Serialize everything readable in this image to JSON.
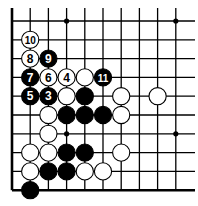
{
  "diagram": {
    "type": "go-board-fragment",
    "corner": "lower-left",
    "columns": 10,
    "rows": 10,
    "grid": {
      "x0": 12,
      "dx": 18.2,
      "y0": 21,
      "dy": 18.8,
      "right_extent": 195,
      "top_extent": 8
    },
    "edges": {
      "left": true,
      "bottom": true,
      "top": false,
      "right": false
    },
    "star_points": [
      [
        3,
        0
      ],
      [
        9,
        0
      ],
      [
        3,
        6
      ],
      [
        9,
        6
      ]
    ],
    "colors": {
      "line": "#000000",
      "black_stone": "#000000",
      "white_stone": "#ffffff",
      "background": "#ffffff"
    },
    "stones": [
      {
        "col": 1,
        "row": 1,
        "color": "white",
        "label": "10"
      },
      {
        "col": 1,
        "row": 2,
        "color": "white",
        "label": "8"
      },
      {
        "col": 2,
        "row": 2,
        "color": "black",
        "label": "9"
      },
      {
        "col": 1,
        "row": 3,
        "color": "black",
        "label": "7"
      },
      {
        "col": 2,
        "row": 3,
        "color": "white",
        "label": "6"
      },
      {
        "col": 3,
        "row": 3,
        "color": "white",
        "label": "4"
      },
      {
        "col": 4,
        "row": 3,
        "color": "white",
        "label": ""
      },
      {
        "col": 5,
        "row": 3,
        "color": "black",
        "label": "11"
      },
      {
        "col": 1,
        "row": 4,
        "color": "black",
        "label": "5"
      },
      {
        "col": 2,
        "row": 4,
        "color": "black",
        "label": "3"
      },
      {
        "col": 3,
        "row": 4,
        "color": "white",
        "label": ""
      },
      {
        "col": 4,
        "row": 4,
        "color": "black",
        "label": ""
      },
      {
        "col": 6,
        "row": 4,
        "color": "white",
        "label": ""
      },
      {
        "col": 8,
        "row": 4,
        "color": "white",
        "label": ""
      },
      {
        "col": 2,
        "row": 5,
        "color": "white",
        "label": ""
      },
      {
        "col": 3,
        "row": 5,
        "color": "black",
        "label": ""
      },
      {
        "col": 4,
        "row": 5,
        "color": "black",
        "label": ""
      },
      {
        "col": 5,
        "row": 5,
        "color": "black",
        "label": ""
      },
      {
        "col": 6,
        "row": 5,
        "color": "white",
        "label": ""
      },
      {
        "col": 2,
        "row": 6,
        "color": "white",
        "label": ""
      },
      {
        "col": 1,
        "row": 7,
        "color": "white",
        "label": ""
      },
      {
        "col": 2,
        "row": 7,
        "color": "white",
        "label": ""
      },
      {
        "col": 3,
        "row": 7,
        "color": "black",
        "label": ""
      },
      {
        "col": 4,
        "row": 7,
        "color": "black",
        "label": ""
      },
      {
        "col": 6,
        "row": 7,
        "color": "white",
        "label": ""
      },
      {
        "col": 1,
        "row": 8,
        "color": "white",
        "label": ""
      },
      {
        "col": 2,
        "row": 8,
        "color": "black",
        "label": ""
      },
      {
        "col": 3,
        "row": 8,
        "color": "black",
        "label": ""
      },
      {
        "col": 4,
        "row": 8,
        "color": "white",
        "label": ""
      },
      {
        "col": 5,
        "row": 8,
        "color": "white",
        "label": ""
      },
      {
        "col": 1,
        "row": 9,
        "color": "black",
        "label": ""
      }
    ]
  }
}
